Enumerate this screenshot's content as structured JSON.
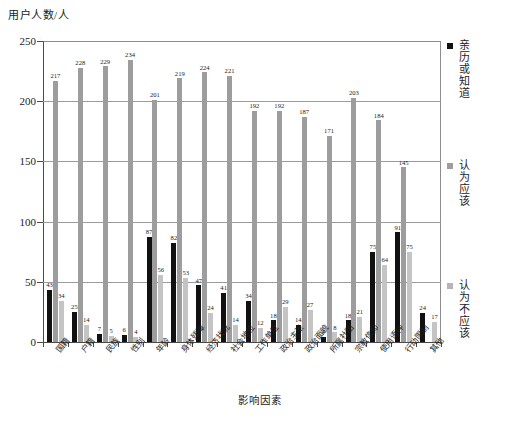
{
  "chart_data": {
    "type": "bar",
    "title": "",
    "xlabel": "影响因素",
    "ylabel": "用户人数/人",
    "ylim": [
      0,
      250
    ],
    "yticks": [
      0,
      50,
      100,
      150,
      200,
      250
    ],
    "grid": true,
    "legend_position": "right",
    "categories": [
      "国籍",
      "户籍",
      "民族",
      "性别",
      "年龄",
      "身体残障",
      "经济状况",
      "社会地位",
      "工作单位",
      "政治主张",
      "政治面貌",
      "所属社团",
      "宗教信仰",
      "使用语种",
      "行动限制",
      "其他"
    ],
    "series": [
      {
        "name": "亲历或知道",
        "color": "#111111",
        "values": [
          43,
          25,
          7,
          6,
          87,
          82,
          47,
          41,
          34,
          18,
          14,
          4,
          18,
          75,
          91,
          24
        ]
      },
      {
        "name": "认为应该",
        "color": "#9d9d9d",
        "values": [
          217,
          228,
          229,
          234,
          201,
          219,
          224,
          221,
          192,
          192,
          187,
          171,
          203,
          184,
          145,
          0
        ]
      },
      {
        "name": "认为不应该",
        "color": "#c4c4c4",
        "values": [
          34,
          14,
          5,
          4,
          56,
          53,
          24,
          14,
          12,
          29,
          27,
          8,
          21,
          64,
          75,
          17
        ]
      }
    ]
  },
  "caption": ""
}
